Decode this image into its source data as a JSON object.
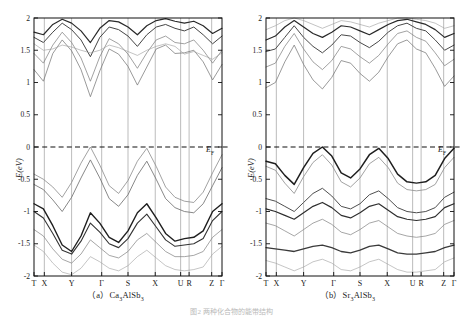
{
  "figure": {
    "partial_bottom_caption": "图2  两种化合物的能带结构"
  },
  "panels": [
    {
      "id": "a",
      "caption": "（a）Ca3AlSb3",
      "caption_prefix": "（a）",
      "caption_formula": "Ca3AlSb3",
      "ylabel": "E(eV)",
      "fermi_label": "EF",
      "chart_data": {
        "type": "line",
        "title": "（a）Ca3AlSb3",
        "xlabel": "",
        "ylabel": "E(eV)",
        "ylim": [
          -2,
          2
        ],
        "yticks": [
          -2,
          -1.5,
          -1,
          -0.5,
          0,
          0.5,
          1,
          1.5,
          2
        ],
        "ytick_labels": [
          "-2",
          "-1.5",
          "-1",
          "-0.5",
          "0",
          "0.5",
          "1",
          "1.5",
          "2"
        ],
        "xtick_labels": [
          "T",
          "X",
          "Y",
          "Γ",
          "S",
          "X",
          "U",
          "R",
          "Z",
          "Γ"
        ],
        "xtick_positions": [
          0.0,
          0.055,
          0.2,
          0.36,
          0.5,
          0.645,
          0.78,
          0.825,
          0.945,
          1.0
        ],
        "grid": "vertical-at-highsym",
        "fermi_level": 0,
        "fermi_line_style": "dashed",
        "band_gap_eV": 0.78,
        "vbm_eV": 0.0,
        "vbm_kpoint": "Γ",
        "cbm_eV": 0.78,
        "cbm_kpoint": "Γ",
        "legend": "none",
        "series": [
          {
            "name": "cb1",
            "color": "#6e6e6e",
            "width": 0.7,
            "values": [
              1.2,
              1.02,
              1.45,
              1.66,
              1.49,
              1.2,
              0.78,
              1.18,
              1.52,
              1.44,
              1.25,
              0.96,
              1.24,
              1.52,
              1.58,
              1.45,
              1.46,
              1.5,
              1.32,
              1.04,
              1.28
            ]
          },
          {
            "name": "cb2",
            "color": "#7a7a7a",
            "width": 0.7,
            "values": [
              1.45,
              1.3,
              1.58,
              1.78,
              1.62,
              1.38,
              1.02,
              1.4,
              1.68,
              1.6,
              1.44,
              1.22,
              1.46,
              1.66,
              1.72,
              1.62,
              1.6,
              1.66,
              1.5,
              1.3,
              1.5
            ]
          },
          {
            "name": "cb3",
            "color": "#454545",
            "width": 1.0,
            "values": [
              1.7,
              1.62,
              1.78,
              1.92,
              1.82,
              1.66,
              1.4,
              1.7,
              1.86,
              1.82,
              1.72,
              1.56,
              1.74,
              1.86,
              1.9,
              1.84,
              1.8,
              1.86,
              1.74,
              1.6,
              1.72
            ]
          },
          {
            "name": "cb4",
            "color": "#2a2a2a",
            "width": 1.2,
            "values": [
              1.78,
              1.74,
              1.9,
              1.98,
              1.92,
              1.8,
              1.62,
              1.84,
              1.96,
              1.94,
              1.86,
              1.74,
              1.88,
              1.96,
              1.99,
              1.95,
              1.92,
              1.95,
              1.88,
              1.76,
              1.84
            ]
          },
          {
            "name": "cb5",
            "color": "#9a9a9a",
            "width": 0.6,
            "values": [
              1.6,
              1.5,
              1.52,
              1.58,
              1.55,
              1.5,
              1.46,
              1.5,
              1.58,
              1.54,
              1.48,
              1.42,
              1.5,
              1.56,
              1.6,
              1.56,
              1.44,
              1.48,
              1.42,
              1.36,
              1.46
            ]
          },
          {
            "name": "vb1",
            "color": "#8a8a8a",
            "width": 0.8,
            "values": [
              -0.42,
              -0.5,
              -0.62,
              -0.78,
              -0.55,
              -0.25,
              0.0,
              -0.28,
              -0.6,
              -0.72,
              -0.52,
              -0.22,
              -0.02,
              -0.3,
              -0.62,
              -0.78,
              -0.84,
              -0.86,
              -0.7,
              -0.4,
              -0.12
            ]
          },
          {
            "name": "vb2",
            "color": "#6a6a6a",
            "width": 0.8,
            "values": [
              -0.58,
              -0.66,
              -0.82,
              -1.0,
              -0.78,
              -0.48,
              -0.2,
              -0.48,
              -0.8,
              -0.92,
              -0.74,
              -0.44,
              -0.22,
              -0.5,
              -0.8,
              -0.94,
              -1.0,
              -1.02,
              -0.88,
              -0.6,
              -0.32
            ]
          },
          {
            "name": "vb3",
            "color": "#1f1f1f",
            "width": 1.4,
            "values": [
              -0.88,
              -0.96,
              -1.22,
              -1.52,
              -1.62,
              -1.38,
              -1.02,
              -1.18,
              -1.4,
              -1.48,
              -1.3,
              -1.02,
              -0.88,
              -1.1,
              -1.34,
              -1.46,
              -1.42,
              -1.4,
              -1.3,
              -1.0,
              -0.88
            ]
          },
          {
            "name": "vb4",
            "color": "#333333",
            "width": 1.1,
            "values": [
              -1.0,
              -1.1,
              -1.34,
              -1.6,
              -1.66,
              -1.46,
              -1.18,
              -1.32,
              -1.5,
              -1.56,
              -1.42,
              -1.18,
              -1.04,
              -1.24,
              -1.44,
              -1.54,
              -1.52,
              -1.5,
              -1.42,
              -1.14,
              -1.0
            ]
          },
          {
            "name": "vb5",
            "color": "#7f7f7f",
            "width": 0.7,
            "values": [
              -1.28,
              -1.38,
              -1.58,
              -1.74,
              -1.8,
              -1.66,
              -1.44,
              -1.56,
              -1.68,
              -1.72,
              -1.62,
              -1.44,
              -1.34,
              -1.48,
              -1.62,
              -1.7,
              -1.7,
              -1.68,
              -1.62,
              -1.4,
              -1.28
            ]
          },
          {
            "name": "vb6",
            "color": "#9e9e9e",
            "width": 0.6,
            "values": [
              -1.52,
              -1.62,
              -1.8,
              -1.94,
              -1.98,
              -1.88,
              -1.7,
              -1.78,
              -1.88,
              -1.92,
              -1.84,
              -1.7,
              -1.6,
              -1.72,
              -1.84,
              -1.9,
              -1.92,
              -1.9,
              -1.86,
              -1.66,
              -1.54
            ]
          }
        ]
      }
    },
    {
      "id": "b",
      "caption": "（b）Sr3AlSb3",
      "caption_prefix": "（b）",
      "caption_formula": "Sr3AlSb3",
      "ylabel": "E(eV)",
      "fermi_label": "EF",
      "chart_data": {
        "type": "line",
        "title": "（b）Sr3AlSb3",
        "xlabel": "",
        "ylabel": "E(eV)",
        "ylim": [
          -2,
          2
        ],
        "yticks": [
          -2,
          -1.5,
          -1,
          -0.5,
          0,
          0.5,
          1,
          1.5,
          2
        ],
        "ytick_labels": [
          "-2",
          "-1.5",
          "-1",
          "-0.5",
          "0",
          "0.5",
          "1",
          "1.5",
          "2"
        ],
        "xtick_labels": [
          "T",
          "X",
          "Y",
          "Γ",
          "S",
          "X",
          "U",
          "R",
          "Z",
          "Γ"
        ],
        "xtick_positions": [
          0.0,
          0.055,
          0.2,
          0.36,
          0.5,
          0.645,
          0.78,
          0.825,
          0.945,
          1.0
        ],
        "grid": "vertical-at-highsym",
        "fermi_level": 0,
        "fermi_line_style": "dashed",
        "band_gap_eV": 0.9,
        "vbm_eV": 0.0,
        "vbm_kpoint": "Γ",
        "cbm_eV": 0.9,
        "cbm_kpoint": "Γ",
        "legend": "none",
        "series": [
          {
            "name": "cb1",
            "color": "#6e6e6e",
            "width": 0.7,
            "values": [
              0.92,
              1.0,
              1.32,
              1.58,
              1.28,
              1.04,
              0.9,
              1.08,
              1.34,
              1.3,
              1.14,
              1.02,
              1.16,
              1.4,
              1.6,
              1.66,
              1.52,
              1.46,
              1.22,
              0.94,
              1.1
            ]
          },
          {
            "name": "cb2",
            "color": "#7a7a7a",
            "width": 0.7,
            "values": [
              1.24,
              1.3,
              1.56,
              1.76,
              1.52,
              1.32,
              1.2,
              1.34,
              1.56,
              1.52,
              1.4,
              1.3,
              1.42,
              1.6,
              1.76,
              1.8,
              1.7,
              1.64,
              1.46,
              1.26,
              1.36
            ]
          },
          {
            "name": "cb3",
            "color": "#4a4a4a",
            "width": 1.0,
            "values": [
              1.48,
              1.52,
              1.7,
              1.88,
              1.7,
              1.56,
              1.46,
              1.58,
              1.74,
              1.72,
              1.62,
              1.54,
              1.64,
              1.78,
              1.88,
              1.92,
              1.84,
              1.8,
              1.66,
              1.5,
              1.58
            ]
          },
          {
            "name": "cb4",
            "color": "#2a2a2a",
            "width": 1.2,
            "values": [
              1.66,
              1.72,
              1.86,
              1.96,
              1.86,
              1.76,
              1.7,
              1.78,
              1.88,
              1.86,
              1.8,
              1.74,
              1.82,
              1.9,
              1.96,
              1.98,
              1.94,
              1.9,
              1.82,
              1.7,
              1.76
            ]
          },
          {
            "name": "cb5",
            "color": "#9a9a9a",
            "width": 0.6,
            "values": [
              1.82,
              1.88,
              1.96,
              2.0,
              1.96,
              1.9,
              1.84,
              1.9,
              1.96,
              1.94,
              1.9,
              1.86,
              1.92,
              1.96,
              2.0,
              2.0,
              1.98,
              1.96,
              1.92,
              1.84,
              1.88
            ]
          },
          {
            "name": "vb1",
            "color": "#1f1f1f",
            "width": 1.5,
            "values": [
              -0.22,
              -0.26,
              -0.44,
              -0.58,
              -0.32,
              -0.1,
              0.0,
              -0.14,
              -0.4,
              -0.48,
              -0.34,
              -0.12,
              -0.02,
              -0.18,
              -0.42,
              -0.54,
              -0.56,
              -0.54,
              -0.44,
              -0.18,
              -0.02
            ]
          },
          {
            "name": "vb2",
            "color": "#8a8a8a",
            "width": 0.8,
            "values": [
              -0.3,
              -0.36,
              -0.56,
              -0.72,
              -0.46,
              -0.24,
              -0.12,
              -0.28,
              -0.54,
              -0.62,
              -0.48,
              -0.26,
              -0.16,
              -0.32,
              -0.56,
              -0.66,
              -0.68,
              -0.66,
              -0.58,
              -0.32,
              -0.16
            ]
          },
          {
            "name": "vb3",
            "color": "#4f4f4f",
            "width": 1.0,
            "values": [
              -0.8,
              -0.84,
              -0.92,
              -1.0,
              -0.86,
              -0.72,
              -0.64,
              -0.76,
              -0.92,
              -0.96,
              -0.88,
              -0.74,
              -0.68,
              -0.8,
              -0.94,
              -1.0,
              -1.02,
              -1.0,
              -0.94,
              -0.78,
              -0.7
            ]
          },
          {
            "name": "vb4",
            "color": "#2f2f2f",
            "width": 1.2,
            "values": [
              -0.96,
              -1.0,
              -1.06,
              -1.12,
              -1.02,
              -0.92,
              -0.86,
              -0.94,
              -1.06,
              -1.1,
              -1.02,
              -0.92,
              -0.88,
              -0.98,
              -1.08,
              -1.12,
              -1.14,
              -1.12,
              -1.08,
              -0.94,
              -0.88
            ]
          },
          {
            "name": "vb5",
            "color": "#7f7f7f",
            "width": 0.7,
            "values": [
              -1.18,
              -1.22,
              -1.3,
              -1.38,
              -1.28,
              -1.18,
              -1.12,
              -1.2,
              -1.32,
              -1.36,
              -1.28,
              -1.18,
              -1.14,
              -1.24,
              -1.34,
              -1.38,
              -1.4,
              -1.38,
              -1.34,
              -1.2,
              -1.14
            ]
          },
          {
            "name": "vb6",
            "color": "#3a3a3a",
            "width": 1.3,
            "values": [
              -1.56,
              -1.58,
              -1.6,
              -1.62,
              -1.58,
              -1.54,
              -1.52,
              -1.56,
              -1.62,
              -1.64,
              -1.6,
              -1.54,
              -1.52,
              -1.58,
              -1.64,
              -1.66,
              -1.66,
              -1.64,
              -1.62,
              -1.56,
              -1.52
            ]
          },
          {
            "name": "vb7",
            "color": "#9e9e9e",
            "width": 0.6,
            "values": [
              -1.76,
              -1.8,
              -1.86,
              -1.92,
              -1.86,
              -1.78,
              -1.74,
              -1.8,
              -1.9,
              -1.92,
              -1.86,
              -1.78,
              -1.74,
              -1.82,
              -1.9,
              -1.94,
              -1.94,
              -1.92,
              -1.9,
              -1.78,
              -1.72
            ]
          }
        ]
      }
    }
  ]
}
